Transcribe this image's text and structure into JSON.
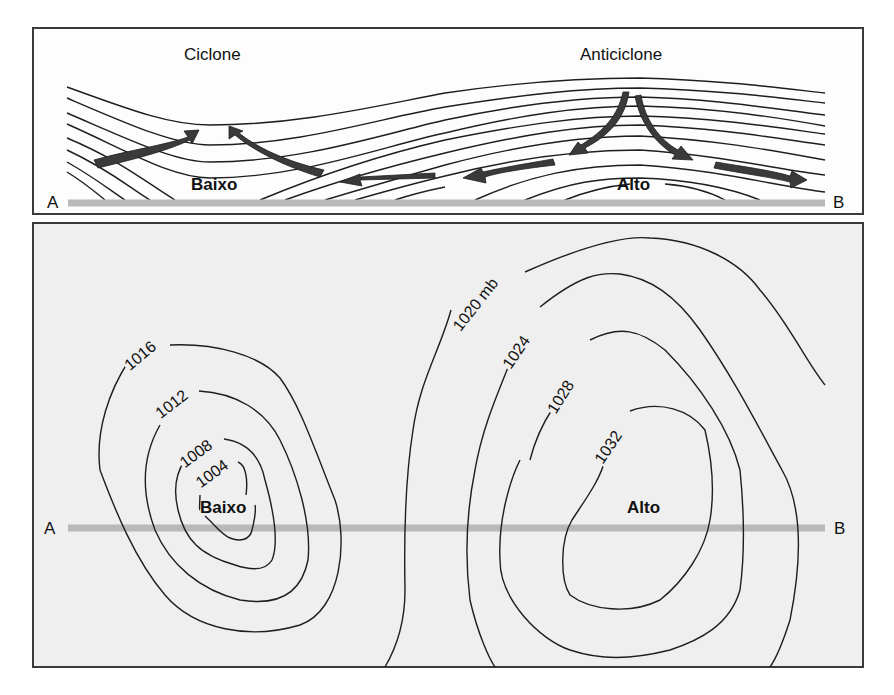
{
  "top_panel": {
    "title_left": "Ciclone",
    "title_right": "Anticiclone",
    "low_label": "Baixo",
    "high_label": "Alto",
    "endpoint_a": "A",
    "endpoint_b": "B"
  },
  "bottom_panel": {
    "low_label": "Baixo",
    "high_label": "Alto",
    "endpoint_a": "A",
    "endpoint_b": "B",
    "isobars": [
      {
        "value": "1016"
      },
      {
        "value": "1012"
      },
      {
        "value": "1008"
      },
      {
        "value": "1004"
      },
      {
        "value": "1020 mb"
      },
      {
        "value": "1024"
      },
      {
        "value": "1028"
      },
      {
        "value": "1032"
      }
    ]
  },
  "colors": {
    "line": "#1e1e1e",
    "arrow": "#3a3a3a",
    "section_line": "#b9b9b9",
    "bottom_bg": "#efefef"
  }
}
